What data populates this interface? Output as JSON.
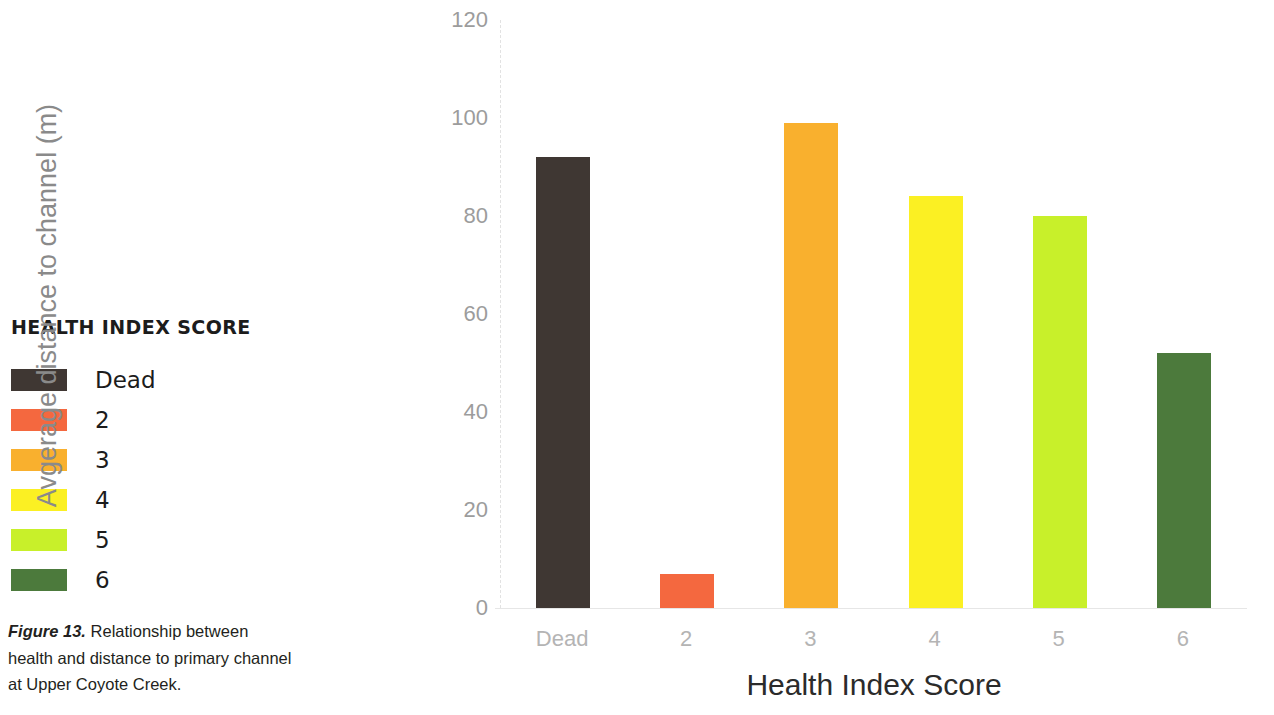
{
  "legend": {
    "title": "HEALTH INDEX SCORE",
    "items": [
      {
        "label": "Dead",
        "color": "#3f3733"
      },
      {
        "label": "2",
        "color": "#f4683f"
      },
      {
        "label": "3",
        "color": "#f9b02e"
      },
      {
        "label": "4",
        "color": "#fbf023"
      },
      {
        "label": "5",
        "color": "#c8f02a"
      },
      {
        "label": "6",
        "color": "#4c7a3c"
      }
    ]
  },
  "caption": {
    "label": "Figure 13.",
    "text": " Relationship between health and distance to primary channel at Upper Coyote Creek."
  },
  "chart_data": {
    "type": "bar",
    "title": "",
    "xlabel": "Health Index Score",
    "ylabel": "Avgerage distance to channel (m)",
    "categories": [
      "Dead",
      "2",
      "3",
      "4",
      "5",
      "6"
    ],
    "values": [
      92,
      7,
      99,
      84,
      80,
      52
    ],
    "colors": [
      "#3f3733",
      "#f4683f",
      "#f9b02e",
      "#fbf023",
      "#c8f02a",
      "#4c7a3c"
    ],
    "ylim": [
      0,
      120
    ],
    "yticks": [
      0,
      20,
      40,
      60,
      80,
      100,
      120
    ],
    "ytick_labels": [
      "0",
      "20",
      "40",
      "60",
      "80",
      "100",
      "120"
    ],
    "grid": false,
    "legend_position": "left-outside"
  }
}
